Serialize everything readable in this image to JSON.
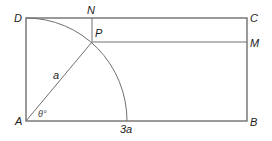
{
  "diagram": {
    "type": "geometry",
    "colors": {
      "stroke": "#707070",
      "text": "#222222"
    },
    "labels": {
      "D": "D",
      "N": "N",
      "P": "P",
      "C": "C",
      "M": "M",
      "A": "A",
      "B": "B",
      "radius": "a",
      "angle": "θ°",
      "base_mark": "3a"
    }
  }
}
